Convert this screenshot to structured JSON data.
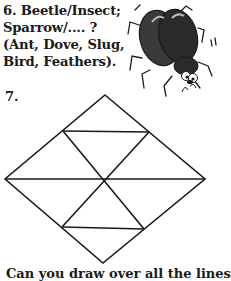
{
  "question6": {
    "lines": [
      "6. Beetle/Insect;",
      "Sparrow/.... ?",
      "(Ant, Dove, Slug,",
      "Bird, Feathers)."
    ]
  },
  "question7": {
    "number": "7."
  },
  "bottom_text": "Can you draw over all the lines",
  "illustration": "beetle-cartoon",
  "colors": {
    "ink": "#1a1a1a",
    "background": "#ffffff"
  }
}
